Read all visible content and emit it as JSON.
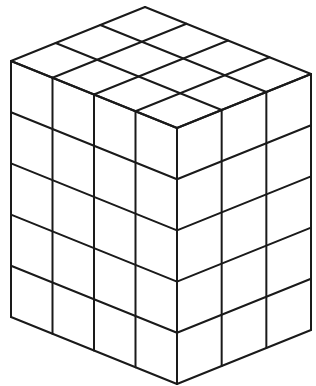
{
  "figure": {
    "type": "line-drawing",
    "dimensions": {
      "left_face_columns": 4,
      "right_face_columns": 3,
      "rows": 5
    },
    "geometry": {
      "front_top": [
        177,
        128
      ],
      "vec_left": [
        -41.5,
        -16.75
      ],
      "vec_right": [
        44.67,
        -18
      ],
      "unit_height": 51.2
    },
    "stroke_color": "#1a1a1a",
    "background": "#ffffff"
  }
}
